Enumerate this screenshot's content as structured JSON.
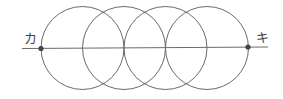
{
  "diagram": {
    "labels": {
      "left": "カ",
      "right": "キ"
    },
    "line": {
      "x1": 22,
      "x2": 268,
      "y": 48
    },
    "points": [
      {
        "name": "カ",
        "cx": 41,
        "cy": 48.5
      },
      {
        "name": "キ",
        "cx": 248,
        "cy": 47.5
      }
    ],
    "circles": [
      {
        "cx": 82.5,
        "cy": 48,
        "r": 41.5
      },
      {
        "cx": 124,
        "cy": 48,
        "r": 41.5
      },
      {
        "cx": 165.5,
        "cy": 48,
        "r": 41.5
      },
      {
        "cx": 207,
        "cy": 48,
        "r": 41.5
      }
    ],
    "stroke_color": "#6b6b6b",
    "point_color": "#444444"
  }
}
